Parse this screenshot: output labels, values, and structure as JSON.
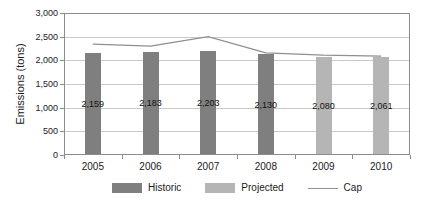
{
  "chart_data": {
    "type": "bar",
    "title": "",
    "ylabel": "Emissions (tons)",
    "categories": [
      "2005",
      "2006",
      "2007",
      "2008",
      "2009",
      "2010"
    ],
    "series": [
      {
        "name": "Historic",
        "type": "bar",
        "color": "#7f7f7f",
        "values": [
          2159,
          2183,
          2203,
          2130,
          null,
          null
        ]
      },
      {
        "name": "Projected",
        "type": "bar",
        "color": "#b5b5b5",
        "values": [
          null,
          null,
          null,
          null,
          2080,
          2061
        ]
      },
      {
        "name": "Cap",
        "type": "line",
        "color": "#8f8f8f",
        "values": [
          2340,
          2300,
          2500,
          2160,
          2110,
          2090
        ]
      }
    ],
    "data_labels": [
      "2,159",
      "2,183",
      "2,203",
      "2,130",
      "2,080",
      "2,061"
    ],
    "ylim": [
      0,
      3000
    ],
    "ytick_step": 500,
    "yticks": [
      "3,000",
      "2,500",
      "2,000",
      "1,500",
      "1,000",
      "500",
      "0"
    ],
    "grid": true,
    "legend_position": "bottom",
    "palette": {
      "gridline": "#c9c9c9",
      "axis": "#8c8c8c",
      "text": "#1a1a1a"
    }
  }
}
